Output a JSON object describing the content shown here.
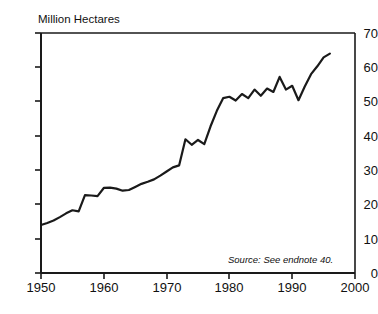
{
  "figure": {
    "title": "",
    "title_visible": false,
    "unit_label": "Million Hectares",
    "source_note": "Source: See endnote 40.",
    "line_color": "#1a1a1a",
    "axis_color": "#1a1a1a",
    "background": "#ffffff"
  },
  "axes": {
    "y_ticks": [
      "70",
      "60",
      "50",
      "40",
      "30",
      "20",
      "10",
      "0"
    ],
    "x_ticks": [
      "1950",
      "1960",
      "1970",
      "1980",
      "1990",
      "2000"
    ]
  },
  "chart_data": {
    "type": "line",
    "title": "",
    "xlabel": "",
    "ylabel": "Million Hectares",
    "xlim": [
      1950,
      2000
    ],
    "ylim": [
      0,
      70
    ],
    "ytick_step": 10,
    "xtick_step": 10,
    "grid": false,
    "legend": "none",
    "annotations": [
      {
        "text": "Source: See endnote 40.",
        "x": 1986,
        "y": 6,
        "style": "italic"
      }
    ],
    "series": [
      {
        "name": "Area",
        "color": "#1a1a1a",
        "x": [
          1950,
          1951,
          1952,
          1953,
          1954,
          1955,
          1956,
          1957,
          1958,
          1959,
          1960,
          1961,
          1962,
          1963,
          1964,
          1965,
          1966,
          1967,
          1968,
          1969,
          1970,
          1971,
          1972,
          1973,
          1974,
          1975,
          1976,
          1977,
          1978,
          1979,
          1980,
          1981,
          1982,
          1983,
          1984,
          1985,
          1986,
          1987,
          1988,
          1989,
          1990,
          1991,
          1992,
          1993,
          1994,
          1995,
          1996
        ],
        "values": [
          14.0,
          14.6,
          15.3,
          16.3,
          17.4,
          18.3,
          18.0,
          22.7,
          22.6,
          22.4,
          24.8,
          24.9,
          24.6,
          24.0,
          24.2,
          25.1,
          26.0,
          26.6,
          27.3,
          28.4,
          29.6,
          30.8,
          31.4,
          39.0,
          37.4,
          38.8,
          37.6,
          42.8,
          47.3,
          51.0,
          51.4,
          50.3,
          52.2,
          51.0,
          53.5,
          51.7,
          53.8,
          52.8,
          57.2,
          53.5,
          54.6,
          50.4,
          54.4,
          58.0,
          60.3,
          62.9,
          64.0
        ]
      }
    ]
  }
}
